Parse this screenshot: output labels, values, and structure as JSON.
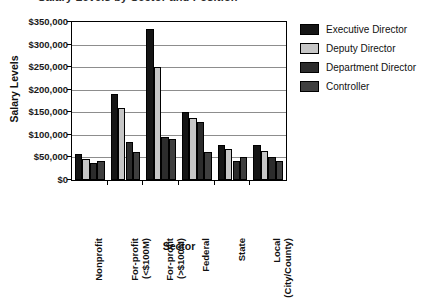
{
  "chart_data": {
    "type": "bar",
    "title": "Salary Levels by Sector and Position",
    "xlabel": "Sector",
    "ylabel": "Salary Levels",
    "ylim": [
      0,
      350000
    ],
    "ytick_labels": [
      "$0",
      "$50,000",
      "$100,000",
      "$150,000",
      "$200,000",
      "$250,000",
      "$300,000",
      "$350,000"
    ],
    "ytick_values": [
      0,
      50000,
      100000,
      150000,
      200000,
      250000,
      300000,
      350000
    ],
    "grid": true,
    "legend_position": "right",
    "categories": [
      "Nonprofit",
      "For-profit (<$100M)",
      "For-profit (>$100M)",
      "Federal",
      "State",
      "Local (City/County)"
    ],
    "category_lines": [
      [
        "Nonprofit"
      ],
      [
        "For-profit",
        "(<$100M)"
      ],
      [
        "For-profit",
        "(>$100M)"
      ],
      [
        "Federal"
      ],
      [
        "State"
      ],
      [
        "Local",
        "(City/County)"
      ]
    ],
    "series": [
      {
        "name": "Executive Director",
        "color": "#151515",
        "values": [
          57000,
          190000,
          335000,
          150000,
          77000,
          77000
        ]
      },
      {
        "name": "Deputy Director",
        "color": "#c6c6c6",
        "values": [
          47000,
          160000,
          250000,
          138000,
          68000,
          65000
        ]
      },
      {
        "name": "Department Director",
        "color": "#2c2c2c",
        "values": [
          37000,
          85000,
          95000,
          128000,
          42000,
          52000
        ]
      },
      {
        "name": "Controller",
        "color": "#3f3f3f",
        "values": [
          42000,
          62000,
          90000,
          62000,
          50000,
          43000
        ]
      }
    ]
  }
}
